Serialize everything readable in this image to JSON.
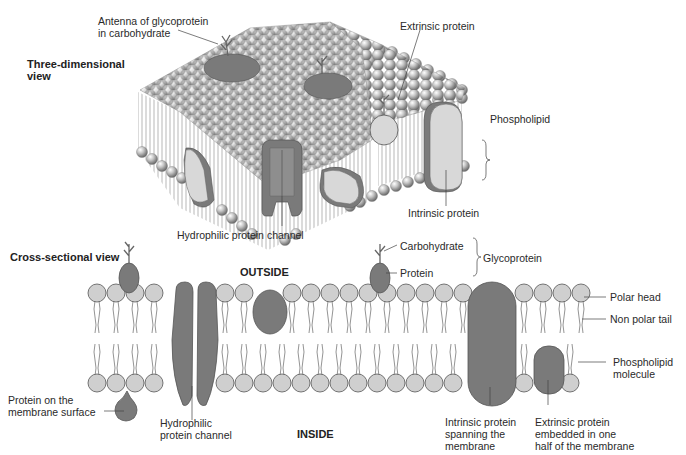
{
  "diagram": {
    "title_3d": "Three-dimensional view",
    "title_3d_line1": "Three-dimensional",
    "title_3d_line2": "view",
    "title_cross": "Cross-sectional view",
    "three_d_labels": {
      "antenna_line1": "Antenna of glycoprotein",
      "antenna_line2": "in carbohydrate",
      "extrinsic": "Extrinsic protein",
      "phospholipid": "Phospholipid",
      "intrinsic": "Intrinsic protein",
      "channel": "Hydrophilic protein channel"
    },
    "cross_labels": {
      "outside": "OUTSIDE",
      "inside": "INSIDE",
      "carbohydrate": "Carbohydrate",
      "protein": "Protein",
      "glycoprotein": "Glycoprotein",
      "polar_head": "Polar head",
      "non_polar_tail": "Non polar tail",
      "phospholipid_molecule_line1": "Phospholipid",
      "phospholipid_molecule_line2": "molecule",
      "surface_protein_line1": "Protein on the",
      "surface_protein_line2": "membrane surface",
      "channel_line1": "Hydrophilic",
      "channel_line2": "protein channel",
      "intrinsic_line1": "Intrinsic protein",
      "intrinsic_line2": "spanning the",
      "intrinsic_line3": "membrane",
      "extrinsic_line1": "Extrinsic protein",
      "extrinsic_line2": "embedded in one",
      "extrinsic_line3": "half of the membrane"
    },
    "colors": {
      "protein_dark": "#7a7a7a",
      "protein_light": "#d8d8d8",
      "head_fill": "#cfcfcf",
      "outline": "#555555"
    }
  }
}
